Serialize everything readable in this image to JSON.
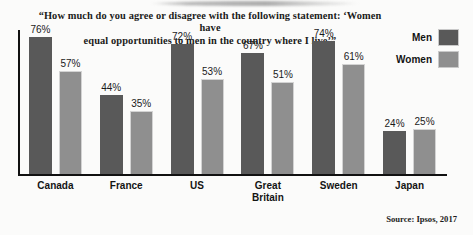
{
  "chart_data": {
    "type": "bar",
    "title": "“How much do you agree or disagree with the following statement: ‘Women have equal opportunities to men in the country where I live’”",
    "title_line1": "“How much do you agree or disagree with the following statement: ‘Women have",
    "title_line2": "equal opportunities to men in the country where I live’”",
    "categories": [
      "Canada",
      "France",
      "US",
      "Great Britain",
      "Sweden",
      "Japan"
    ],
    "series": [
      {
        "name": "Men",
        "color": "#595959",
        "values": [
          76,
          44,
          72,
          67,
          74,
          24
        ]
      },
      {
        "name": "Women",
        "color": "#8f8f8f",
        "values": [
          57,
          35,
          53,
          51,
          61,
          25
        ]
      }
    ],
    "value_labels": [
      [
        "76%",
        "57%"
      ],
      [
        "44%",
        "35%"
      ],
      [
        "72%",
        "53%"
      ],
      [
        "67%",
        "51%"
      ],
      [
        "74%",
        "61%"
      ],
      [
        "24%",
        "25%"
      ]
    ],
    "xlabel": "",
    "ylabel": "",
    "ylim": [
      0,
      80
    ],
    "grid": false,
    "legend_position": "top-right",
    "unit": "%"
  },
  "legend": {
    "items": [
      {
        "label": "Men",
        "color": "#595959"
      },
      {
        "label": "Women",
        "color": "#8f8f8f"
      }
    ]
  },
  "categories_display": [
    {
      "line1": "Canada",
      "line2": ""
    },
    {
      "line1": "France",
      "line2": ""
    },
    {
      "line1": "US",
      "line2": ""
    },
    {
      "line1": "Great",
      "line2": "Britain"
    },
    {
      "line1": "Sweden",
      "line2": ""
    },
    {
      "line1": "Japan",
      "line2": ""
    }
  ],
  "source": "Source: Ipsos, 2017"
}
